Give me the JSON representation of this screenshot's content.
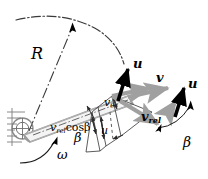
{
  "figure": {
    "kind": "velocity-triangle-diagram",
    "background": "#ffffff"
  },
  "colors": {
    "outline": "#9a9a9a",
    "gray_vector": "#a0a0a0",
    "black_vector": "#000000",
    "thin_line": "#4a4a4a",
    "hatch": "#7d7d7d"
  },
  "labels": {
    "radius": "R",
    "omega": "ω",
    "u_tip": "u",
    "v": "v",
    "u_right": "u",
    "v_rel_right": "v",
    "v_rel_right_sub": "rel",
    "v_theta": "v",
    "v_theta_sub": "θ",
    "u_mid": "u",
    "vrel_cos_beta_sym": "v",
    "vrel_cos_beta_sub": "rel",
    "vrel_cos_beta_rest": "cosβ",
    "beta_left": "β",
    "beta_right": "β"
  },
  "elements": {
    "hub": "hatched-fixed-support",
    "blade": "rotor-blade-arm",
    "tip_arc": "dash-dot-tip-path-arc",
    "radius_line": "dash-dot-radius-with-arrow",
    "omega_arc": "curved-rotation-arrow",
    "beta_arc_left": "small-angle-arc",
    "beta_arc_right": "large-angle-arc"
  },
  "vectors": [
    {
      "name": "u-at-blade-tip",
      "symbol": "u",
      "style": "black-bold",
      "desc": "blade speed at tip, up-left"
    },
    {
      "name": "v-absolute",
      "symbol": "v",
      "style": "gray",
      "desc": "absolute velocity, to the right"
    },
    {
      "name": "v-rel-relative",
      "symbol": "v_rel",
      "style": "gray",
      "desc": "relative velocity, down-right along blade"
    },
    {
      "name": "u-right",
      "symbol": "u",
      "style": "black-bold",
      "desc": "blade speed repeated, up-right of triangle"
    },
    {
      "name": "v-theta-component",
      "symbol": "v_theta",
      "style": "thin",
      "desc": "tangential component of v"
    },
    {
      "name": "u-component",
      "symbol": "u",
      "style": "thin",
      "desc": "blade speed component"
    },
    {
      "name": "v-rel-cos-beta",
      "symbol": "v_rel cos beta",
      "style": "thin",
      "desc": "axial projection of relative velocity"
    }
  ]
}
